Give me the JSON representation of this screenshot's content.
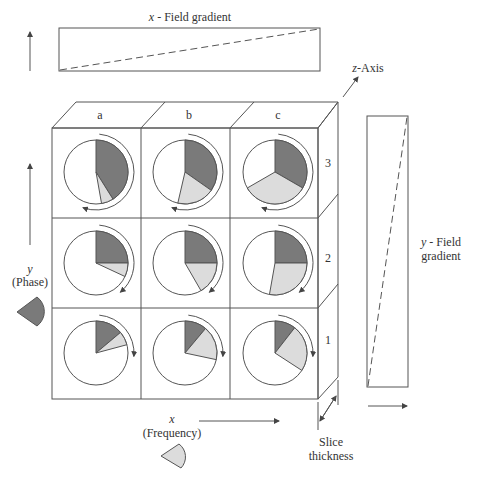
{
  "labels": {
    "x_field_gradient": "x-Field gradient",
    "x_field_italic": "x",
    "x_field_rest": " - Field gradient",
    "z_axis_italic": "z",
    "z_axis_rest": "-Axis",
    "y_field_line1_italic": "y",
    "y_field_line1_rest": " - Field",
    "y_field_line2": "gradient",
    "y_axis_letter": "y",
    "y_axis_name": "(Phase)",
    "x_axis_letter": "x",
    "x_axis_name": "(Frequency)",
    "slice_line1": "Slice",
    "slice_line2": "thickness"
  },
  "columns": [
    "a",
    "b",
    "c"
  ],
  "rows": [
    "3",
    "2",
    "1"
  ],
  "colors": {
    "dark_sector": "#7a7a7a",
    "light_sector": "#dcdcdc",
    "line": "#555555"
  },
  "cells": [
    {
      "row": "3",
      "col": "a",
      "dark_deg": 148,
      "light_deg": 22,
      "arrow": "ccw"
    },
    {
      "row": "3",
      "col": "b",
      "dark_deg": 125,
      "light_deg": 68,
      "arrow": "ccw"
    },
    {
      "row": "3",
      "col": "c",
      "dark_deg": 120,
      "light_deg": 120,
      "arrow": "ccw"
    },
    {
      "row": "2",
      "col": "a",
      "dark_deg": 90,
      "light_deg": 25,
      "arrow": "cw"
    },
    {
      "row": "2",
      "col": "b",
      "dark_deg": 90,
      "light_deg": 60,
      "arrow": "cw"
    },
    {
      "row": "2",
      "col": "c",
      "dark_deg": 90,
      "light_deg": 100,
      "arrow": "ccw"
    },
    {
      "row": "1",
      "col": "a",
      "dark_deg": 50,
      "light_deg": 25,
      "arrow": "cw"
    },
    {
      "row": "1",
      "col": "b",
      "dark_deg": 40,
      "light_deg": 62,
      "arrow": "cw"
    },
    {
      "row": "1",
      "col": "c",
      "dark_deg": 38,
      "light_deg": 85,
      "arrow": "cw"
    }
  ]
}
